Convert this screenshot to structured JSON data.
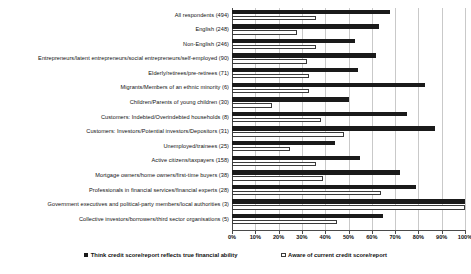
{
  "chart_data": {
    "type": "bar",
    "orientation": "horizontal",
    "title": "",
    "xlabel": "",
    "ylabel": "",
    "xlim": [
      0,
      100
    ],
    "grid": true,
    "legend_position": "bottom",
    "xticks": [
      "0%",
      "10%",
      "20%",
      "30%",
      "40%",
      "50%",
      "60%",
      "70%",
      "80%",
      "90%",
      "100%"
    ],
    "categories": [
      "All respondents (494)",
      "English (248)",
      "Non-English (246)",
      "Entrepreneurs/latent entrepreneurs/social entrepreneurs/self-employed (90)",
      "Elderly/retirees/pre-retirees (71)",
      "Migrants/Members of an ethnic minority (6)",
      "Children/Parents of young children (30)",
      "Customers: Indebted/Overindebted households (8)",
      "Customers: Investors/Potential investors/Depositors (31)",
      "Unemployed/trainees (25)",
      "Active citizens/taxpayers (158)",
      "Mortgage owners/home owners/first-time buyers (38)",
      "Professionals in financial services/financial experts (28)",
      "Government executives and political-party members/local authorities (3)",
      "Collective investors/borrowers/third sector organisations (5)"
    ],
    "series": [
      {
        "name": "Think credit score/report reflects true financial ability",
        "color": "#1a1a1a",
        "style": "filled",
        "values": [
          68,
          63,
          53,
          62,
          54,
          83,
          50,
          75,
          87,
          44,
          55,
          72,
          79,
          100,
          65
        ]
      },
      {
        "name": "Aware of current credit score/report",
        "color": "#ffffff",
        "style": "outlined",
        "values": [
          36,
          28,
          36,
          32,
          33,
          33,
          17,
          38,
          48,
          25,
          36,
          39,
          64,
          100,
          45
        ]
      }
    ]
  },
  "legend": {
    "items": [
      {
        "swatch": "filled-square",
        "label": "Think credit score/report reflects true financial ability"
      },
      {
        "swatch": "open-square",
        "label": "Aware of current credit score/report"
      }
    ]
  }
}
